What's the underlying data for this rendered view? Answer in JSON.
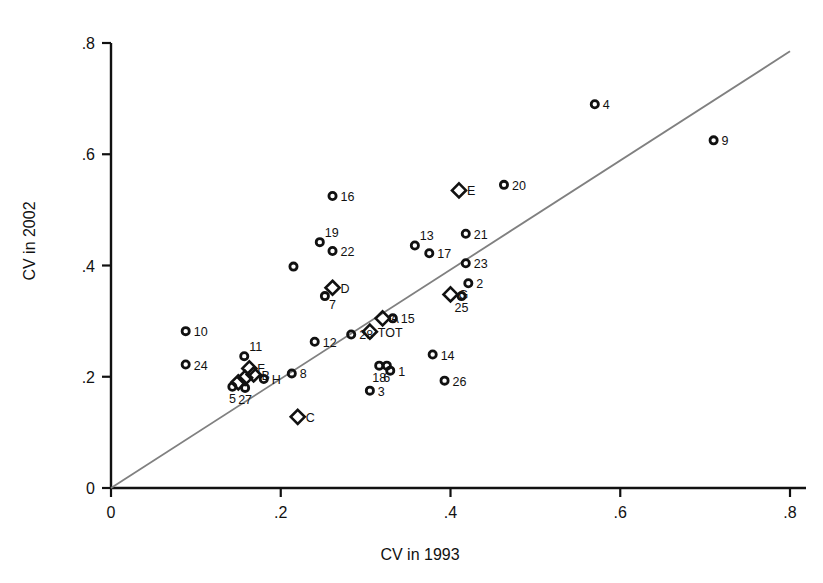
{
  "chart_data": {
    "type": "scatter",
    "title": "",
    "xlabel": "CV in 1993",
    "ylabel": "CV in 2002",
    "xlim": [
      0,
      0.8
    ],
    "ylim": [
      0,
      0.8
    ],
    "xticks": [
      "0",
      ".2",
      ".4",
      ".6",
      ".8"
    ],
    "xtick_values": [
      0,
      0.2,
      0.4,
      0.6,
      0.8
    ],
    "yticks": [
      "0",
      ".2",
      ".4",
      ".6",
      ".8"
    ],
    "ytick_values": [
      0,
      0.2,
      0.4,
      0.6,
      0.8
    ],
    "grid": false,
    "legend": "none",
    "reference_line": {
      "label": "45-degree reference line",
      "x": [
        0.0,
        0.8
      ],
      "y": [
        0.0,
        0.785
      ],
      "color": "#808080"
    },
    "marker_styles": {
      "circle": "open circle (numbered units)",
      "diamond": "open diamond (lettered groups and TOT)"
    },
    "points": [
      {
        "label": "4",
        "marker": "circle",
        "x": 0.57,
        "y": 0.69,
        "label_pos": "right"
      },
      {
        "label": "9",
        "marker": "circle",
        "x": 0.71,
        "y": 0.625,
        "label_pos": "right"
      },
      {
        "label": "20",
        "marker": "circle",
        "x": 0.463,
        "y": 0.545,
        "label_pos": "right"
      },
      {
        "label": "E",
        "marker": "diamond",
        "x": 0.41,
        "y": 0.535,
        "label_pos": "right"
      },
      {
        "label": "16",
        "marker": "circle",
        "x": 0.261,
        "y": 0.525,
        "label_pos": "right"
      },
      {
        "label": "21",
        "marker": "circle",
        "x": 0.418,
        "y": 0.457,
        "label_pos": "right"
      },
      {
        "label": "19",
        "marker": "circle",
        "x": 0.246,
        "y": 0.442,
        "label_pos": "upper-right"
      },
      {
        "label": "13",
        "marker": "circle",
        "x": 0.358,
        "y": 0.436,
        "label_pos": "upper-right"
      },
      {
        "label": "22",
        "marker": "circle",
        "x": 0.261,
        "y": 0.426,
        "label_pos": "right"
      },
      {
        "label": "17",
        "marker": "circle",
        "x": 0.375,
        "y": 0.422,
        "label_pos": "right"
      },
      {
        "label": "23",
        "marker": "circle",
        "x": 0.418,
        "y": 0.404,
        "label_pos": "right"
      },
      {
        "label": "",
        "marker": "circle",
        "x": 0.215,
        "y": 0.398,
        "label_pos": "none"
      },
      {
        "label": "2",
        "marker": "circle",
        "x": 0.421,
        "y": 0.368,
        "label_pos": "right"
      },
      {
        "label": "D",
        "marker": "diamond",
        "x": 0.261,
        "y": 0.36,
        "label_pos": "right"
      },
      {
        "label": "G",
        "marker": "diamond",
        "x": 0.4,
        "y": 0.348,
        "label_pos": "right"
      },
      {
        "label": "7",
        "marker": "circle",
        "x": 0.252,
        "y": 0.345,
        "label_pos": "lower-right"
      },
      {
        "label": "25",
        "marker": "circle",
        "x": 0.413,
        "y": 0.345,
        "label_pos": "below"
      },
      {
        "label": "A",
        "marker": "diamond",
        "x": 0.32,
        "y": 0.305,
        "label_pos": "right"
      },
      {
        "label": "15",
        "marker": "circle",
        "x": 0.332,
        "y": 0.305,
        "label_pos": "right"
      },
      {
        "label": "10",
        "marker": "circle",
        "x": 0.088,
        "y": 0.282,
        "label_pos": "right"
      },
      {
        "label": "TOT",
        "marker": "diamond",
        "x": 0.305,
        "y": 0.281,
        "label_pos": "right"
      },
      {
        "label": "28",
        "marker": "circle",
        "x": 0.283,
        "y": 0.276,
        "label_pos": "right"
      },
      {
        "label": "12",
        "marker": "circle",
        "x": 0.24,
        "y": 0.263,
        "label_pos": "right"
      },
      {
        "label": "14",
        "marker": "circle",
        "x": 0.379,
        "y": 0.24,
        "label_pos": "right"
      },
      {
        "label": "11",
        "marker": "circle",
        "x": 0.157,
        "y": 0.237,
        "label_pos": "upper-right"
      },
      {
        "label": "24",
        "marker": "circle",
        "x": 0.088,
        "y": 0.222,
        "label_pos": "right"
      },
      {
        "label": "18",
        "marker": "circle",
        "x": 0.316,
        "y": 0.22,
        "label_pos": "below"
      },
      {
        "label": "6",
        "marker": "circle",
        "x": 0.325,
        "y": 0.22,
        "label_pos": "below"
      },
      {
        "label": "F",
        "marker": "diamond",
        "x": 0.163,
        "y": 0.215,
        "label_pos": "right"
      },
      {
        "label": "8",
        "marker": "circle",
        "x": 0.213,
        "y": 0.206,
        "label_pos": "right"
      },
      {
        "label": "B",
        "marker": "diamond",
        "x": 0.168,
        "y": 0.204,
        "label_pos": "right"
      },
      {
        "label": "1",
        "marker": "circle",
        "x": 0.329,
        "y": 0.211,
        "label_pos": "right"
      },
      {
        "label": "H",
        "marker": "circle",
        "x": 0.18,
        "y": 0.196,
        "label_pos": "right"
      },
      {
        "label": "",
        "marker": "diamond",
        "x": 0.158,
        "y": 0.198,
        "label_pos": "none"
      },
      {
        "label": "",
        "marker": "diamond",
        "x": 0.15,
        "y": 0.19,
        "label_pos": "none"
      },
      {
        "label": "26",
        "marker": "circle",
        "x": 0.393,
        "y": 0.193,
        "label_pos": "right"
      },
      {
        "label": "5",
        "marker": "circle",
        "x": 0.143,
        "y": 0.182,
        "label_pos": "below"
      },
      {
        "label": "27",
        "marker": "circle",
        "x": 0.158,
        "y": 0.18,
        "label_pos": "below"
      },
      {
        "label": "3",
        "marker": "circle",
        "x": 0.305,
        "y": 0.175,
        "label_pos": "right"
      },
      {
        "label": "C",
        "marker": "diamond",
        "x": 0.22,
        "y": 0.128,
        "label_pos": "right"
      }
    ]
  }
}
